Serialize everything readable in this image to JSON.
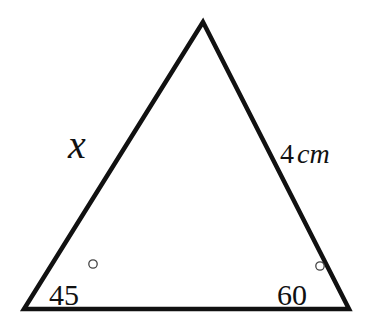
{
  "diagram": {
    "type": "triangle",
    "vertices": {
      "apex": [
        203,
        22
      ],
      "bottom_left": [
        24,
        309
      ],
      "bottom_right": [
        349,
        309
      ]
    },
    "stroke_color": "#111111",
    "labels": {
      "left_side": "x",
      "right_side_number": "4",
      "right_side_unit": "cm",
      "left_angle": "45",
      "right_angle": "60"
    },
    "degree_symbol": "degree-circle"
  }
}
